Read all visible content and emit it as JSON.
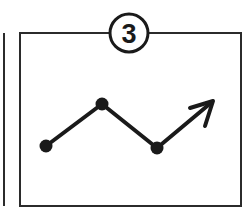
{
  "figure": {
    "title": "",
    "badge": {
      "label": "3",
      "shape": "circle-outline",
      "center": [
        129,
        33
      ],
      "radius": 19
    },
    "panel": {
      "name": "diagram-frame",
      "x": 20,
      "y": 33,
      "width": 221,
      "height": 173,
      "border_color": "#2b2b2b",
      "fill_color": "#ffffff"
    },
    "cropped_neighbor_edge": {
      "x": 4,
      "y_start": 33,
      "y_end": 206,
      "color": "#2b2b2b"
    },
    "colors": {
      "ink": "#1a1a1a",
      "frame": "#2b2b2b",
      "background": "#ffffff"
    }
  },
  "chart_data": {
    "type": "line",
    "title": "",
    "subtitle": "",
    "xlabel": "",
    "ylabel": "",
    "grid": false,
    "legend": null,
    "axis_visible": false,
    "marker": "filled-circle",
    "marker_radius": 6,
    "line_width": 4,
    "xlim": [
      20,
      241
    ],
    "ylim": [
      33,
      206
    ],
    "points": [
      {
        "label": "p1",
        "x": 46,
        "y": 146,
        "marker": true
      },
      {
        "label": "p2",
        "x": 102,
        "y": 104,
        "marker": true
      },
      {
        "label": "p3",
        "x": 157,
        "y": 148,
        "marker": true
      },
      {
        "label": "p4",
        "x": 212,
        "y": 102,
        "marker": false
      }
    ],
    "values": [
      146,
      104,
      148,
      102
    ],
    "categories": [
      "p1",
      "p2",
      "p3",
      "p4"
    ],
    "series": [
      {
        "name": "trend",
        "values": [
          146,
          104,
          148,
          102
        ]
      }
    ],
    "annotations": [
      {
        "type": "arrowhead",
        "at": [
          212,
          102
        ],
        "direction": "up-right",
        "style": "open-v",
        "barb1": [
          190,
          108
        ],
        "barb2": [
          205,
          126
        ]
      }
    ]
  }
}
